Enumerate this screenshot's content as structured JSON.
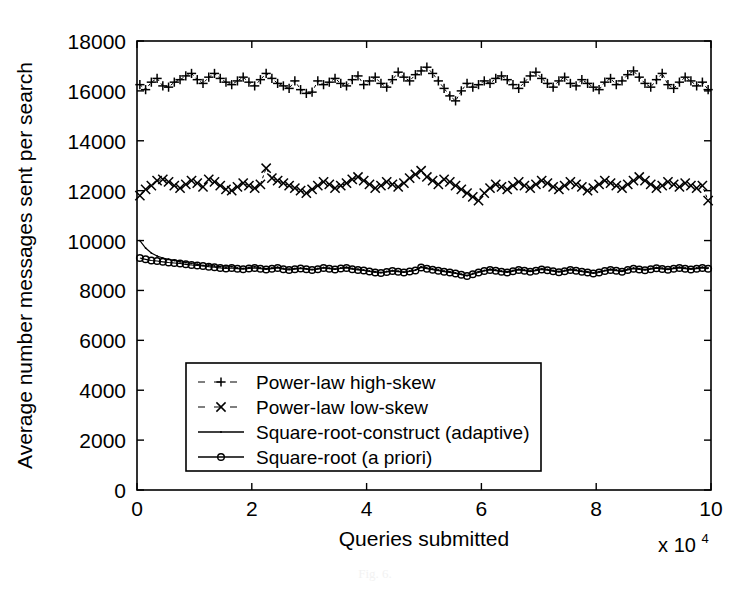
{
  "figure": {
    "caption": "Fig. 6.",
    "background": "#ffffff",
    "ink_color": "#000000"
  },
  "chart_data": {
    "type": "line",
    "title": "",
    "subtitle": "",
    "xlabel": "Queries submitted",
    "ylabel": "Average number messages sent per search",
    "x_multiplier_label": "x 10",
    "x_multiplier_exponent": "4",
    "xlim": [
      0,
      10
    ],
    "ylim": [
      0,
      18000
    ],
    "xticks": [
      0,
      2,
      4,
      6,
      8,
      10
    ],
    "xtick_labels": [
      "0",
      "2",
      "4",
      "6",
      "8",
      "10"
    ],
    "yticks": [
      0,
      2000,
      4000,
      6000,
      8000,
      10000,
      12000,
      14000,
      16000,
      18000
    ],
    "ytick_labels": [
      "0",
      "2000",
      "4000",
      "6000",
      "8000",
      "10000",
      "12000",
      "14000",
      "16000",
      "18000"
    ],
    "grid": false,
    "legend_position": "lower-center-inside",
    "legend_entries": [
      {
        "label": "Power-law high-skew",
        "marker": "plus",
        "linestyle": "dashed"
      },
      {
        "label": "Power-law low-skew",
        "marker": "cross",
        "linestyle": "dashed"
      },
      {
        "label": "Square-root-construct (adaptive)",
        "marker": "dot",
        "linestyle": "solid"
      },
      {
        "label": "Square-root (a priori)",
        "marker": "circle",
        "linestyle": "solid"
      }
    ],
    "x": [
      0.05,
      0.15,
      0.25,
      0.35,
      0.45,
      0.55,
      0.65,
      0.75,
      0.85,
      0.95,
      1.05,
      1.15,
      1.25,
      1.35,
      1.45,
      1.55,
      1.65,
      1.75,
      1.85,
      1.95,
      2.05,
      2.15,
      2.25,
      2.35,
      2.45,
      2.55,
      2.65,
      2.75,
      2.85,
      2.95,
      3.05,
      3.15,
      3.25,
      3.35,
      3.45,
      3.55,
      3.65,
      3.75,
      3.85,
      3.95,
      4.05,
      4.15,
      4.25,
      4.35,
      4.45,
      4.55,
      4.65,
      4.75,
      4.85,
      4.95,
      5.05,
      5.15,
      5.25,
      5.35,
      5.45,
      5.55,
      5.65,
      5.75,
      5.85,
      5.95,
      6.05,
      6.15,
      6.25,
      6.35,
      6.45,
      6.55,
      6.65,
      6.75,
      6.85,
      6.95,
      7.05,
      7.15,
      7.25,
      7.35,
      7.45,
      7.55,
      7.65,
      7.75,
      7.85,
      7.95,
      8.05,
      8.15,
      8.25,
      8.35,
      8.45,
      8.55,
      8.65,
      8.75,
      8.85,
      8.95,
      9.05,
      9.15,
      9.25,
      9.35,
      9.45,
      9.55,
      9.65,
      9.75,
      9.85,
      9.95
    ],
    "series": [
      {
        "name": "Power-law high-skew",
        "marker": "plus",
        "linestyle": "dashed",
        "values": [
          16250,
          16050,
          16350,
          16500,
          16200,
          16150,
          16350,
          16450,
          16600,
          16700,
          16450,
          16300,
          16550,
          16700,
          16500,
          16350,
          16250,
          16400,
          16550,
          16350,
          16200,
          16450,
          16700,
          16500,
          16300,
          16200,
          16100,
          16400,
          16050,
          15900,
          15950,
          16400,
          16250,
          16350,
          16500,
          16300,
          16200,
          16450,
          16600,
          16250,
          16400,
          16550,
          16300,
          16150,
          16450,
          16750,
          16550,
          16400,
          16650,
          16800,
          16950,
          16700,
          16400,
          16100,
          15800,
          15600,
          16000,
          16300,
          16150,
          16250,
          16400,
          16300,
          16500,
          16600,
          16450,
          16250,
          16100,
          16350,
          16600,
          16750,
          16500,
          16300,
          16150,
          16400,
          16550,
          16300,
          16200,
          16450,
          16300,
          16150,
          16050,
          16350,
          16500,
          16250,
          16400,
          16650,
          16800,
          16550,
          16300,
          16150,
          16450,
          16700,
          16250,
          16100,
          16350,
          16550,
          16400,
          16200,
          16350,
          16050
        ]
      },
      {
        "name": "Power-law low-skew",
        "marker": "cross",
        "linestyle": "dashed",
        "values": [
          11800,
          12050,
          12200,
          12400,
          12450,
          12350,
          12200,
          12100,
          12250,
          12400,
          12300,
          12150,
          12450,
          12350,
          12200,
          12050,
          12000,
          12150,
          12300,
          12200,
          12100,
          12250,
          12900,
          12500,
          12400,
          12300,
          12200,
          12100,
          12000,
          11900,
          12050,
          12200,
          12350,
          12250,
          12100,
          12200,
          12300,
          12450,
          12550,
          12400,
          12250,
          12100,
          12200,
          12350,
          12250,
          12150,
          12300,
          12500,
          12650,
          12800,
          12550,
          12400,
          12250,
          12450,
          12350,
          12200,
          12050,
          11900,
          11750,
          11600,
          11900,
          12100,
          12250,
          12150,
          12050,
          12200,
          12350,
          12200,
          12100,
          12250,
          12400,
          12300,
          12150,
          12050,
          12200,
          12350,
          12250,
          12150,
          12000,
          12100,
          12250,
          12400,
          12300,
          12200,
          12100,
          12250,
          12400,
          12550,
          12400,
          12250,
          12100,
          12200,
          12350,
          12250,
          12150,
          12300,
          12200,
          12100,
          12200,
          11600
        ]
      },
      {
        "name": "Square-root-construct (adaptive)",
        "marker": "dot",
        "linestyle": "solid",
        "values": [
          10000,
          9700,
          9500,
          9380,
          9300,
          9250,
          9200,
          9150,
          9120,
          9080,
          9050,
          9000,
          9020,
          8980,
          8950,
          8930,
          8960,
          8900,
          8880,
          8920,
          8950,
          8900,
          8870,
          8900,
          8930,
          8880,
          8850,
          8880,
          8900,
          8870,
          8840,
          8880,
          8920,
          8890,
          8860,
          8900,
          8930,
          8880,
          8850,
          8820,
          8780,
          8750,
          8720,
          8760,
          8800,
          8770,
          8740,
          8780,
          8820,
          8950,
          8900,
          8860,
          8820,
          8780,
          8750,
          8700,
          8650,
          8600,
          8680,
          8750,
          8800,
          8850,
          8820,
          8780,
          8750,
          8800,
          8850,
          8820,
          8780,
          8820,
          8870,
          8840,
          8800,
          8760,
          8800,
          8850,
          8820,
          8780,
          8750,
          8700,
          8750,
          8800,
          8850,
          8820,
          8780,
          8850,
          8900,
          8870,
          8840,
          8880,
          8920,
          8890,
          8860,
          8900,
          8930,
          8900,
          8870,
          8900,
          8930,
          8900
        ]
      },
      {
        "name": "Square-root (a priori)",
        "marker": "circle",
        "linestyle": "solid",
        "values": [
          9300,
          9250,
          9200,
          9180,
          9150,
          9120,
          9100,
          9080,
          9050,
          9020,
          9000,
          8980,
          8950,
          8930,
          8900,
          8880,
          8900,
          8870,
          8850,
          8880,
          8900,
          8870,
          8840,
          8870,
          8900,
          8850,
          8820,
          8850,
          8880,
          8850,
          8820,
          8850,
          8900,
          8870,
          8840,
          8880,
          8900,
          8850,
          8820,
          8800,
          8760,
          8720,
          8700,
          8740,
          8780,
          8750,
          8720,
          8760,
          8800,
          8920,
          8870,
          8830,
          8790,
          8750,
          8720,
          8680,
          8630,
          8580,
          8650,
          8720,
          8780,
          8820,
          8790,
          8750,
          8720,
          8770,
          8820,
          8790,
          8750,
          8790,
          8840,
          8810,
          8770,
          8730,
          8770,
          8820,
          8790,
          8750,
          8720,
          8680,
          8720,
          8780,
          8820,
          8790,
          8750,
          8820,
          8870,
          8840,
          8810,
          8850,
          8890,
          8860,
          8830,
          8870,
          8900,
          8870,
          8840,
          8870,
          8900,
          8870
        ]
      }
    ]
  }
}
